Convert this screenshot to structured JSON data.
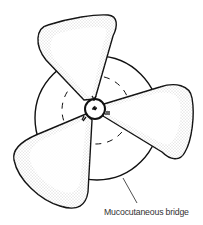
{
  "diagram": {
    "label": "Mucocutaneous bridge",
    "colors": {
      "stroke": "#111111",
      "stipple": "#888888",
      "background": "#ffffff",
      "text": "#333333"
    }
  }
}
